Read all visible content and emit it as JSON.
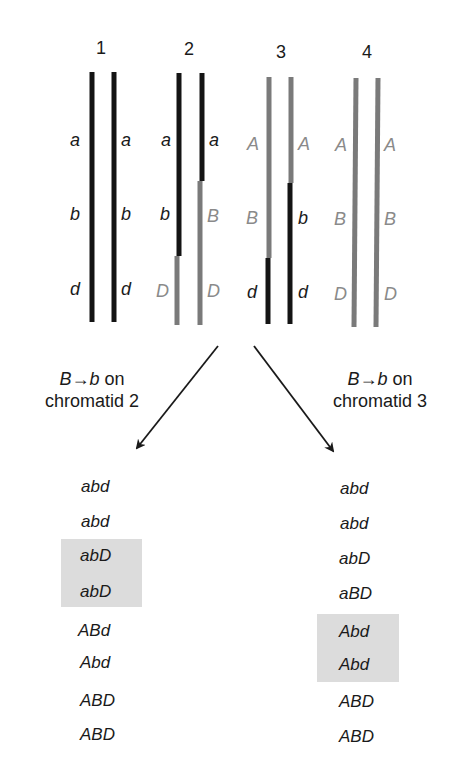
{
  "chromatid_numbers": [
    "1",
    "2",
    "3",
    "4"
  ],
  "colors": {
    "recessive_strand": "#141414",
    "dominant_strand": "#7a7a7a",
    "dominant_label": "#8a8a8a",
    "highlight": "#dcdcdc"
  },
  "pairs": [
    {
      "number": "1",
      "left_labels": [
        "a",
        "b",
        "d"
      ],
      "right_labels": [
        "a",
        "b",
        "d"
      ]
    },
    {
      "number": "2",
      "left_labels": [
        "a",
        "b",
        "D"
      ],
      "right_labels": [
        "a",
        "B",
        "D"
      ]
    },
    {
      "number": "3",
      "left_labels": [
        "A",
        "B",
        "d"
      ],
      "right_labels": [
        "A",
        "b",
        "d"
      ]
    },
    {
      "number": "4",
      "left_labels": [
        "A",
        "B",
        "D"
      ],
      "right_labels": [
        "A",
        "B",
        "D"
      ]
    }
  ],
  "left_branch": {
    "caption_line1_gene_from": "B",
    "caption_line1_arrow": "→",
    "caption_line1_gene_to": "b",
    "caption_line1_suffix": " on",
    "caption_line2": "chromatid 2",
    "genotypes": [
      "abd",
      "abd",
      "abD",
      "abD",
      "ABd",
      "Abd",
      "ABD",
      "ABD"
    ],
    "highlighted_indices": [
      2,
      3
    ]
  },
  "right_branch": {
    "caption_line1_gene_from": "B",
    "caption_line1_arrow": "→",
    "caption_line1_gene_to": "b",
    "caption_line1_suffix": " on",
    "caption_line2": "chromatid 3",
    "genotypes": [
      "abd",
      "abd",
      "abD",
      "aBD",
      "Abd",
      "Abd",
      "ABD",
      "ABD"
    ],
    "highlighted_indices": [
      4,
      5
    ]
  }
}
